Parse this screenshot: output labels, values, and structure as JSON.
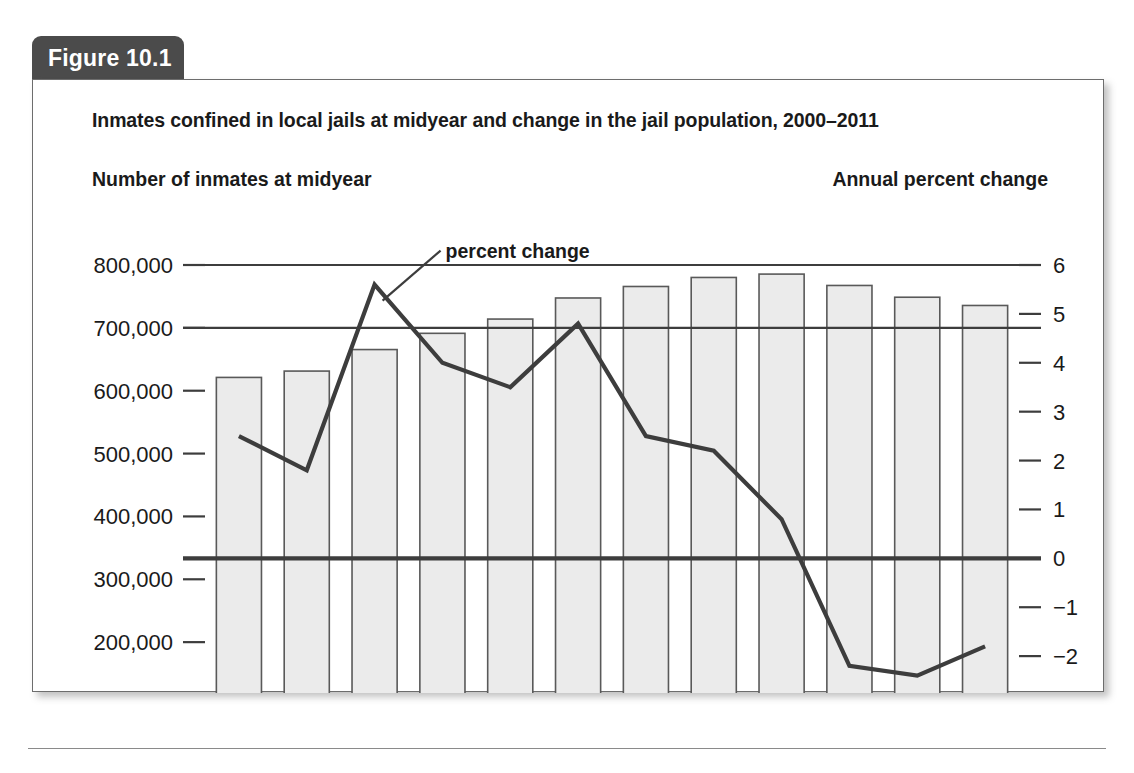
{
  "figure": {
    "tab_label": "Figure 10.1",
    "title": "Inmates confined in local jails at midyear and change in the jail population, 2000–2011"
  },
  "chart_data": {
    "type": "bar",
    "title": "Inmates confined in local jails at midyear and change in the jail population, 2000–2011",
    "xlabel": "",
    "ylabel": "Number of inmates at midyear",
    "y2label": "Annual percent change",
    "grid": "partial",
    "legend_position": "inline-annotation",
    "categories": [
      "2000",
      "2001",
      "2002",
      "2003",
      "2004",
      "2005",
      "2006",
      "2007",
      "2008",
      "2009",
      "2010",
      "2011"
    ],
    "series": [
      {
        "name": "Number of inmates at midyear",
        "type": "bar",
        "axis": "left",
        "values": [
          621149,
          631240,
          665475,
          691301,
          713990,
          747529,
          765819,
          780174,
          785533,
          767434,
          748728,
          735601
        ]
      },
      {
        "name": "percent change",
        "type": "line",
        "axis": "right",
        "values": [
          2.5,
          1.8,
          5.6,
          4.0,
          3.5,
          4.8,
          2.5,
          2.2,
          0.8,
          -2.2,
          -2.4,
          -1.8
        ]
      }
    ],
    "ylim": [
      100000,
      800000
    ],
    "yticks": [
      "800,000",
      "700,000",
      "600,000",
      "500,000",
      "400,000",
      "300,000",
      "200,000",
      "100,000"
    ],
    "ytick_values": [
      800000,
      700000,
      600000,
      500000,
      400000,
      300000,
      200000,
      100000
    ],
    "y2lim": [
      -3,
      6
    ],
    "y2ticks": [
      "6",
      "5",
      "4",
      "3",
      "2",
      "1",
      "0",
      "−1",
      "−2",
      "−3"
    ],
    "y2tick_values": [
      6,
      5,
      4,
      3,
      2,
      1,
      0,
      -1,
      -2,
      -3
    ],
    "annotations": [
      {
        "text": "percent change",
        "points_to": "2002"
      }
    ],
    "colors": {
      "bar_fill": "#ebebeb",
      "bar_stroke": "#595959",
      "line": "#3d3d3d",
      "axis": "#3d3d3d",
      "text": "#1a1a1a",
      "tab_background": "#4b4b4b",
      "tab_text": "#ffffff"
    }
  }
}
